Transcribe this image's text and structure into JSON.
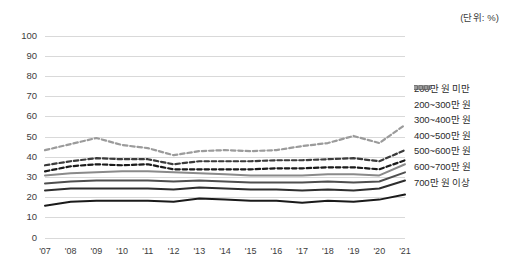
{
  "unit_note": "(단위: %)",
  "axis": {
    "y_ticks": [
      "0",
      "10",
      "20",
      "30",
      "40",
      "50",
      "60",
      "70",
      "80",
      "90",
      "100"
    ],
    "x_ticks": [
      "'07",
      "'08",
      "'09",
      "'10",
      "'11",
      "'12",
      "'13",
      "'14",
      "'15",
      "'16",
      "'17",
      "'18",
      "'19",
      "'20",
      "'21"
    ]
  },
  "legend": {
    "items": [
      {
        "label": "200만 원 미만",
        "color": "#1a1a1a",
        "style": "solid"
      },
      {
        "label": "200~300만 원",
        "color": "#2e2e2e",
        "style": "solid"
      },
      {
        "label": "300~400만 원",
        "color": "#4f4f4f",
        "style": "solid"
      },
      {
        "label": "400~500만 원",
        "color": "#8a8a8a",
        "style": "solid"
      },
      {
        "label": "500~600만 원",
        "color": "#1a1a1a",
        "style": "dashed"
      },
      {
        "label": "600~700만 원",
        "color": "#3b3b3b",
        "style": "dashed"
      },
      {
        "label": "700만 원 이상",
        "color": "#9b9b9b",
        "style": "dashed"
      }
    ]
  },
  "chart_data": {
    "type": "line",
    "title": "",
    "xlabel": "",
    "ylabel": "",
    "ylim": [
      0,
      100
    ],
    "grid": true,
    "legend_position": "right",
    "categories": [
      "'07",
      "'08",
      "'09",
      "'10",
      "'11",
      "'12",
      "'13",
      "'14",
      "'15",
      "'16",
      "'17",
      "'18",
      "'19",
      "'20",
      "'21"
    ],
    "series": [
      {
        "name": "200만 원 미만",
        "color": "#1a1a1a",
        "style": "solid",
        "values": [
          16.0,
          18.0,
          18.5,
          18.5,
          18.5,
          18.0,
          19.5,
          19.0,
          18.5,
          18.5,
          17.5,
          18.5,
          18.0,
          19.0,
          21.5
        ]
      },
      {
        "name": "200~300만 원",
        "color": "#2e2e2e",
        "style": "solid",
        "values": [
          23.5,
          24.5,
          24.5,
          24.5,
          24.5,
          24.0,
          25.0,
          24.5,
          24.0,
          24.0,
          23.5,
          24.0,
          23.5,
          24.5,
          28.5
        ]
      },
      {
        "name": "300~400만 원",
        "color": "#4f4f4f",
        "style": "solid",
        "values": [
          27.0,
          28.0,
          28.5,
          28.5,
          28.5,
          28.0,
          28.5,
          28.0,
          27.5,
          27.5,
          27.5,
          28.0,
          27.5,
          28.0,
          32.5
        ]
      },
      {
        "name": "400~500만 원",
        "color": "#8a8a8a",
        "style": "solid",
        "values": [
          31.0,
          32.0,
          32.5,
          33.0,
          33.0,
          32.5,
          32.0,
          31.5,
          31.0,
          31.0,
          31.0,
          31.5,
          31.5,
          31.0,
          36.5
        ]
      },
      {
        "name": "500~600만 원",
        "color": "#1a1a1a",
        "style": "dashed",
        "values": [
          33.0,
          35.5,
          36.5,
          36.0,
          36.5,
          34.0,
          34.0,
          34.0,
          34.0,
          34.5,
          34.5,
          35.0,
          35.0,
          34.0,
          38.5
        ]
      },
      {
        "name": "600~700만 원",
        "color": "#3b3b3b",
        "style": "dashed",
        "values": [
          36.0,
          38.0,
          39.5,
          39.0,
          39.0,
          36.5,
          38.0,
          38.0,
          38.0,
          38.5,
          38.5,
          39.0,
          39.5,
          38.0,
          43.5
        ]
      },
      {
        "name": "700만 원 이상",
        "color": "#9b9b9b",
        "style": "dashed",
        "values": [
          43.5,
          46.5,
          49.5,
          46.0,
          44.5,
          41.0,
          43.0,
          43.5,
          43.0,
          43.5,
          45.5,
          47.0,
          50.5,
          47.0,
          56.0
        ]
      }
    ]
  }
}
